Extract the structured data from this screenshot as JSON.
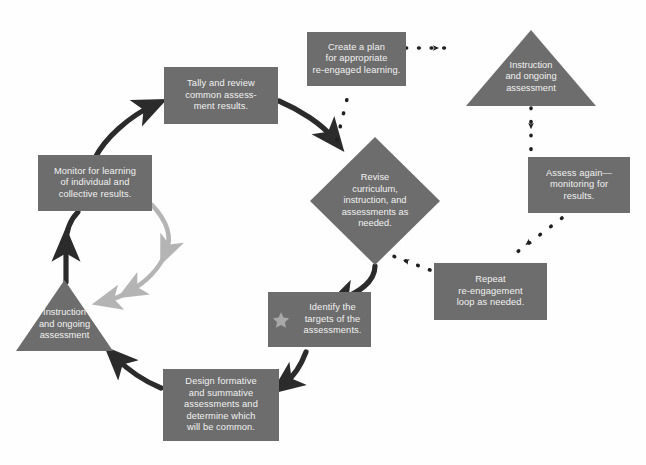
{
  "diagram": {
    "colors": {
      "node_fill": "#6d6d6d",
      "node_text": "#f2f2f2",
      "main_arrow": "#2b2b2b",
      "inner_arrow": "#b4b4b4",
      "dotted_arrow": "#1f1f1f",
      "star": "#a8a8a8",
      "background": "#fefefe"
    },
    "nodes": [
      {
        "id": "tally",
        "shape": "rectangle",
        "label": "Tally and review common assess-ment results.",
        "lines": [
          "Tally and review",
          "common assess-",
          "ment results."
        ]
      },
      {
        "id": "monitor",
        "shape": "rectangle",
        "label": "Monitor for learning of individual and collective results.",
        "lines": [
          "Monitor for learning",
          "of individual and",
          "collective results."
        ]
      },
      {
        "id": "instruction-left",
        "shape": "triangle",
        "label": "Instruction and ongoing assessment",
        "lines": [
          "Instruction",
          "and ongoing",
          "assessment"
        ]
      },
      {
        "id": "design",
        "shape": "rectangle",
        "label": "Design formative and summative assessments and determine which will be common.",
        "lines": [
          "Design formative",
          "and summative",
          "assessments and",
          "determine which",
          "will be common."
        ]
      },
      {
        "id": "identify",
        "shape": "rectangle-with-star",
        "icon": "star-icon",
        "label": "Identify the targets of the assessments.",
        "lines": [
          "Identify the",
          "targets of the",
          "assessments."
        ]
      },
      {
        "id": "revise",
        "shape": "diamond",
        "label": "Revise curriculum, instruction, and assessments as needed.",
        "lines": [
          "Revise",
          "curriculum,",
          "instruction, and",
          "assessments as",
          "needed."
        ]
      },
      {
        "id": "create-plan",
        "shape": "rectangle",
        "label": "Create a plan for appropriate re-engaged learning.",
        "lines": [
          "Create a plan",
          "for appropriate",
          "re-engaged learning."
        ]
      },
      {
        "id": "instruction-right",
        "shape": "triangle",
        "label": "Instruction and ongoing assessment",
        "lines": [
          "Instruction",
          "and ongoing",
          "assessment"
        ]
      },
      {
        "id": "assess-again",
        "shape": "rectangle",
        "label": "Assess again—monitoring for results.",
        "lines": [
          "Assess again—",
          "monitoring for",
          "results."
        ]
      },
      {
        "id": "repeat",
        "shape": "rectangle",
        "label": "Repeat re-engagement loop as needed.",
        "lines": [
          "Repeat",
          "re-engagement",
          "loop as needed."
        ]
      }
    ],
    "connections": [
      {
        "from": "monitor",
        "to": "tally",
        "style": "solid-dark"
      },
      {
        "from": "tally",
        "to": "revise",
        "style": "solid-dark"
      },
      {
        "from": "revise",
        "to": "identify",
        "style": "solid-dark"
      },
      {
        "from": "identify",
        "to": "design",
        "style": "solid-dark"
      },
      {
        "from": "design",
        "to": "instruction-left",
        "style": "solid-dark"
      },
      {
        "from": "instruction-left",
        "to": "monitor",
        "style": "solid-dark"
      },
      {
        "from": "monitor",
        "to": "instruction-left",
        "style": "solid-light-inner"
      },
      {
        "from": "create-plan",
        "to": "instruction-right",
        "style": "dotted"
      },
      {
        "from": "instruction-right",
        "to": "assess-again",
        "style": "dotted"
      },
      {
        "from": "assess-again",
        "to": "repeat",
        "style": "dotted"
      },
      {
        "from": "repeat",
        "to": "revise",
        "style": "dotted"
      },
      {
        "from": "revise",
        "to": "create-plan",
        "style": "dotted"
      }
    ]
  }
}
